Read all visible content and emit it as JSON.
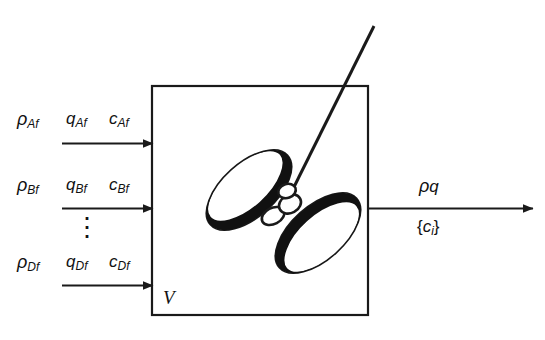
{
  "diagram": {
    "vessel": {
      "volume_label": "V",
      "name": "reactor-vessel"
    },
    "impeller": {
      "name": "impeller",
      "shaft_name": "impeller-shaft",
      "hub_name": "impeller-hub",
      "blade_upper_name": "impeller-blade-upper",
      "blade_lower_name": "impeller-blade-lower"
    },
    "inlets": [
      {
        "density": "ρ",
        "density_sub": "Af",
        "flow": "q",
        "flow_sub": "Af",
        "conc": "c",
        "conc_sub": "Af"
      },
      {
        "density": "ρ",
        "density_sub": "Bf",
        "flow": "q",
        "flow_sub": "Bf",
        "conc": "c",
        "conc_sub": "Bf"
      },
      {
        "density": "ρ",
        "density_sub": "Df",
        "flow": "q",
        "flow_sub": "Df",
        "conc": "c",
        "conc_sub": "Df"
      }
    ],
    "ellipsis": "⋮",
    "outlet": {
      "density": "ρ",
      "flow": "q",
      "conc_open": "{",
      "conc": "c",
      "conc_sub": "i",
      "conc_close": "}"
    },
    "colors": {
      "line": "#1a1a1a",
      "fill": "#ffffff",
      "blade_shade": "#111111",
      "background": "#ffffff"
    }
  }
}
